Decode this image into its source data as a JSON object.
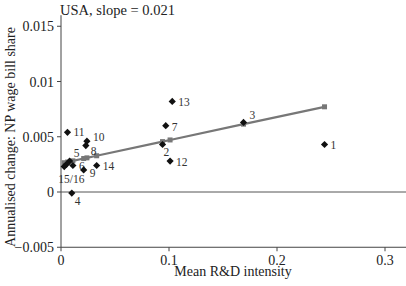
{
  "chart_data": {
    "type": "scatter",
    "title": "USA, slope = 0.021",
    "xlabel": "Mean R&D intensity",
    "ylabel": "Annualised change: NP wage bill share",
    "xlim": [
      0,
      0.32
    ],
    "ylim": [
      -0.005,
      0.016
    ],
    "xticks": [
      0,
      0.1,
      0.2,
      0.3
    ],
    "xtick_labels": [
      "0",
      "0.1",
      "0.2",
      "0.3"
    ],
    "yticks": [
      -0.005,
      0,
      0.005,
      0.01,
      0.015
    ],
    "ytick_labels": [
      "-0.005",
      "0",
      "0.005",
      "0.01",
      "0.015"
    ],
    "grid": false,
    "legend": null,
    "zero_line": true,
    "series": [
      {
        "name": "Industries",
        "marker": "diamond",
        "color": "#111111",
        "points": [
          {
            "label": "1",
            "x": 0.244,
            "y": 0.0043
          },
          {
            "label": "2",
            "x": 0.094,
            "y": 0.0043
          },
          {
            "label": "3",
            "x": 0.169,
            "y": 0.0063
          },
          {
            "label": "4",
            "x": 0.01,
            "y": -0.0001
          },
          {
            "label": "5",
            "x": 0.008,
            "y": 0.0028
          },
          {
            "label": "6",
            "x": 0.011,
            "y": 0.0024
          },
          {
            "label": "7",
            "x": 0.097,
            "y": 0.006
          },
          {
            "label": "8",
            "x": 0.023,
            "y": 0.0042
          },
          {
            "label": "9",
            "x": 0.021,
            "y": 0.002
          },
          {
            "label": "10",
            "x": 0.024,
            "y": 0.0046
          },
          {
            "label": "11",
            "x": 0.006,
            "y": 0.0054
          },
          {
            "label": "12",
            "x": 0.101,
            "y": 0.0028
          },
          {
            "label": "13",
            "x": 0.103,
            "y": 0.0082
          },
          {
            "label": "14",
            "x": 0.033,
            "y": 0.0024
          },
          {
            "label": "15",
            "x": 0.003,
            "y": 0.0023
          },
          {
            "label": "16",
            "x": 0.005,
            "y": 0.0025
          }
        ]
      },
      {
        "name": "Fitted",
        "type": "line",
        "marker": "square",
        "color": "#777777",
        "slope": 0.021,
        "points": [
          {
            "x": 0.003,
            "y": 0.00265
          },
          {
            "x": 0.006,
            "y": 0.00271
          },
          {
            "x": 0.011,
            "y": 0.00282
          },
          {
            "x": 0.021,
            "y": 0.00303
          },
          {
            "x": 0.024,
            "y": 0.00309
          },
          {
            "x": 0.033,
            "y": 0.00328
          },
          {
            "x": 0.094,
            "y": 0.00456
          },
          {
            "x": 0.101,
            "y": 0.00471
          },
          {
            "x": 0.169,
            "y": 0.00614
          },
          {
            "x": 0.244,
            "y": 0.00771
          }
        ]
      }
    ],
    "point_label_overrides": {
      "15": "15/16",
      "16": ""
    }
  }
}
